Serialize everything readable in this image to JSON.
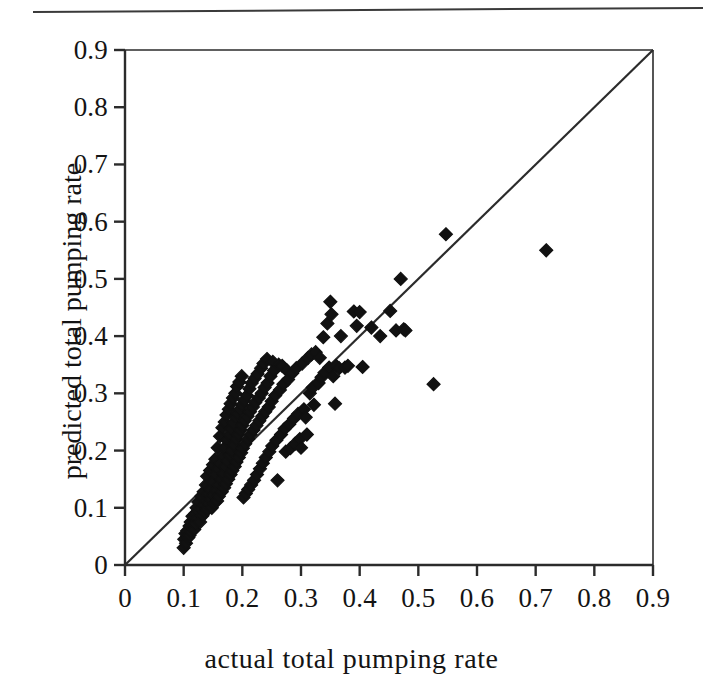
{
  "figure": {
    "top_rule": "horizontal-rule",
    "background_color": "#ffffff",
    "marker_color": "#111111",
    "axis_color": "#2b2b2b"
  },
  "chart_data": {
    "type": "scatter",
    "title": "",
    "subtitle": "",
    "xlabel": "actual  total  pumping  rate",
    "ylabel": "predicted total pumping rate",
    "xlim": [
      0,
      0.9
    ],
    "ylim": [
      0,
      0.9
    ],
    "xticks": [
      0,
      0.1,
      0.2,
      0.3,
      0.4,
      0.5,
      0.6,
      0.7,
      0.8,
      0.9
    ],
    "yticks": [
      0,
      0.1,
      0.2,
      0.3,
      0.4,
      0.5,
      0.6,
      0.7,
      0.8,
      0.9
    ],
    "xtick_labels": [
      "0",
      "0.1",
      "0.2",
      "0.3",
      "0.4",
      "0.5",
      "0.6",
      "0.7",
      "0.8",
      "0.9"
    ],
    "ytick_labels": [
      "0",
      "0.1",
      "0.2",
      "0.3",
      "0.4",
      "0.5",
      "0.6",
      "0.7",
      "0.8",
      "0.9"
    ],
    "grid": false,
    "legend": null,
    "legend_position": "none",
    "marker": "diamond",
    "marker_size": 13,
    "reference_line": {
      "name": "one-to-one-line",
      "kind": "identity",
      "from": [
        0,
        0
      ],
      "to": [
        0.9,
        0.9
      ],
      "label": "1:1 line"
    },
    "annotations": [],
    "points": [
      [
        0.1,
        0.03
      ],
      [
        0.101,
        0.045
      ],
      [
        0.103,
        0.055
      ],
      [
        0.104,
        0.038
      ],
      [
        0.106,
        0.06
      ],
      [
        0.108,
        0.048
      ],
      [
        0.11,
        0.068
      ],
      [
        0.11,
        0.052
      ],
      [
        0.112,
        0.075
      ],
      [
        0.113,
        0.058
      ],
      [
        0.115,
        0.085
      ],
      [
        0.116,
        0.07
      ],
      [
        0.118,
        0.062
      ],
      [
        0.12,
        0.09
      ],
      [
        0.12,
        0.072
      ],
      [
        0.122,
        0.1
      ],
      [
        0.124,
        0.082
      ],
      [
        0.125,
        0.11
      ],
      [
        0.126,
        0.092
      ],
      [
        0.128,
        0.075
      ],
      [
        0.13,
        0.12
      ],
      [
        0.13,
        0.098
      ],
      [
        0.132,
        0.086
      ],
      [
        0.134,
        0.128
      ],
      [
        0.135,
        0.105
      ],
      [
        0.136,
        0.092
      ],
      [
        0.138,
        0.14
      ],
      [
        0.139,
        0.112
      ],
      [
        0.14,
        0.155
      ],
      [
        0.14,
        0.098
      ],
      [
        0.142,
        0.125
      ],
      [
        0.143,
        0.108
      ],
      [
        0.145,
        0.165
      ],
      [
        0.146,
        0.132
      ],
      [
        0.147,
        0.115
      ],
      [
        0.148,
        0.1
      ],
      [
        0.15,
        0.175
      ],
      [
        0.15,
        0.145
      ],
      [
        0.151,
        0.122
      ],
      [
        0.152,
        0.108
      ],
      [
        0.154,
        0.185
      ],
      [
        0.155,
        0.158
      ],
      [
        0.156,
        0.13
      ],
      [
        0.157,
        0.112
      ],
      [
        0.158,
        0.205
      ],
      [
        0.159,
        0.168
      ],
      [
        0.16,
        0.14
      ],
      [
        0.16,
        0.12
      ],
      [
        0.162,
        0.225
      ],
      [
        0.163,
        0.178
      ],
      [
        0.164,
        0.15
      ],
      [
        0.165,
        0.128
      ],
      [
        0.166,
        0.24
      ],
      [
        0.167,
        0.19
      ],
      [
        0.168,
        0.16
      ],
      [
        0.169,
        0.135
      ],
      [
        0.17,
        0.25
      ],
      [
        0.17,
        0.205
      ],
      [
        0.171,
        0.172
      ],
      [
        0.172,
        0.142
      ],
      [
        0.173,
        0.262
      ],
      [
        0.174,
        0.218
      ],
      [
        0.175,
        0.182
      ],
      [
        0.176,
        0.15
      ],
      [
        0.177,
        0.272
      ],
      [
        0.178,
        0.228
      ],
      [
        0.179,
        0.192
      ],
      [
        0.18,
        0.158
      ],
      [
        0.18,
        0.282
      ],
      [
        0.181,
        0.238
      ],
      [
        0.182,
        0.2
      ],
      [
        0.183,
        0.165
      ],
      [
        0.184,
        0.292
      ],
      [
        0.185,
        0.248
      ],
      [
        0.186,
        0.21
      ],
      [
        0.187,
        0.172
      ],
      [
        0.188,
        0.3
      ],
      [
        0.189,
        0.258
      ],
      [
        0.19,
        0.22
      ],
      [
        0.19,
        0.18
      ],
      [
        0.191,
        0.312
      ],
      [
        0.192,
        0.265
      ],
      [
        0.193,
        0.228
      ],
      [
        0.194,
        0.188
      ],
      [
        0.195,
        0.32
      ],
      [
        0.196,
        0.272
      ],
      [
        0.197,
        0.236
      ],
      [
        0.198,
        0.196
      ],
      [
        0.199,
        0.33
      ],
      [
        0.2,
        0.28
      ],
      [
        0.2,
        0.244
      ],
      [
        0.201,
        0.204
      ],
      [
        0.202,
        0.118
      ],
      [
        0.203,
        0.288
      ],
      [
        0.204,
        0.252
      ],
      [
        0.205,
        0.212
      ],
      [
        0.206,
        0.125
      ],
      [
        0.208,
        0.296
      ],
      [
        0.209,
        0.26
      ],
      [
        0.21,
        0.22
      ],
      [
        0.21,
        0.132
      ],
      [
        0.212,
        0.308
      ],
      [
        0.213,
        0.268
      ],
      [
        0.214,
        0.228
      ],
      [
        0.215,
        0.14
      ],
      [
        0.216,
        0.318
      ],
      [
        0.218,
        0.276
      ],
      [
        0.219,
        0.236
      ],
      [
        0.22,
        0.148
      ],
      [
        0.221,
        0.326
      ],
      [
        0.222,
        0.284
      ],
      [
        0.224,
        0.244
      ],
      [
        0.225,
        0.158
      ],
      [
        0.226,
        0.334
      ],
      [
        0.228,
        0.292
      ],
      [
        0.229,
        0.252
      ],
      [
        0.23,
        0.168
      ],
      [
        0.232,
        0.344
      ],
      [
        0.233,
        0.3
      ],
      [
        0.234,
        0.26
      ],
      [
        0.235,
        0.178
      ],
      [
        0.236,
        0.352
      ],
      [
        0.238,
        0.31
      ],
      [
        0.239,
        0.268
      ],
      [
        0.24,
        0.188
      ],
      [
        0.242,
        0.36
      ],
      [
        0.243,
        0.318
      ],
      [
        0.245,
        0.276
      ],
      [
        0.246,
        0.198
      ],
      [
        0.248,
        0.33
      ],
      [
        0.25,
        0.286
      ],
      [
        0.251,
        0.208
      ],
      [
        0.252,
        0.355
      ],
      [
        0.254,
        0.34
      ],
      [
        0.256,
        0.296
      ],
      [
        0.258,
        0.218
      ],
      [
        0.26,
        0.148
      ],
      [
        0.262,
        0.35
      ],
      [
        0.264,
        0.306
      ],
      [
        0.266,
        0.228
      ],
      [
        0.268,
        0.348
      ],
      [
        0.27,
        0.316
      ],
      [
        0.272,
        0.238
      ],
      [
        0.274,
        0.198
      ],
      [
        0.276,
        0.34
      ],
      [
        0.278,
        0.324
      ],
      [
        0.28,
        0.246
      ],
      [
        0.282,
        0.204
      ],
      [
        0.285,
        0.335
      ],
      [
        0.288,
        0.256
      ],
      [
        0.29,
        0.212
      ],
      [
        0.292,
        0.344
      ],
      [
        0.295,
        0.264
      ],
      [
        0.298,
        0.22
      ],
      [
        0.3,
        0.205
      ],
      [
        0.302,
        0.352
      ],
      [
        0.305,
        0.272
      ],
      [
        0.308,
        0.258
      ],
      [
        0.31,
        0.228
      ],
      [
        0.312,
        0.362
      ],
      [
        0.315,
        0.3
      ],
      [
        0.318,
        0.368
      ],
      [
        0.32,
        0.31
      ],
      [
        0.322,
        0.28
      ],
      [
        0.325,
        0.372
      ],
      [
        0.33,
        0.318
      ],
      [
        0.332,
        0.362
      ],
      [
        0.335,
        0.328
      ],
      [
        0.338,
        0.398
      ],
      [
        0.34,
        0.336
      ],
      [
        0.345,
        0.422
      ],
      [
        0.348,
        0.345
      ],
      [
        0.35,
        0.46
      ],
      [
        0.352,
        0.438
      ],
      [
        0.355,
        0.33
      ],
      [
        0.358,
        0.282
      ],
      [
        0.36,
        0.348
      ],
      [
        0.365,
        0.344
      ],
      [
        0.368,
        0.4
      ],
      [
        0.375,
        0.345
      ],
      [
        0.38,
        0.348
      ],
      [
        0.39,
        0.443
      ],
      [
        0.395,
        0.418
      ],
      [
        0.4,
        0.442
      ],
      [
        0.405,
        0.346
      ],
      [
        0.42,
        0.415
      ],
      [
        0.435,
        0.4
      ],
      [
        0.452,
        0.444
      ],
      [
        0.462,
        0.41
      ],
      [
        0.47,
        0.5
      ],
      [
        0.475,
        0.412
      ],
      [
        0.478,
        0.41
      ],
      [
        0.526,
        0.316
      ],
      [
        0.547,
        0.578
      ],
      [
        0.718,
        0.55
      ]
    ]
  },
  "axes": {
    "x": {
      "label": "actual  total  pumping  rate",
      "ticks": [
        {
          "value": 0,
          "label": "0"
        },
        {
          "value": 0.1,
          "label": "0.1"
        },
        {
          "value": 0.2,
          "label": "0.2"
        },
        {
          "value": 0.3,
          "label": "0.3"
        },
        {
          "value": 0.4,
          "label": "0.4"
        },
        {
          "value": 0.5,
          "label": "0.5"
        },
        {
          "value": 0.6,
          "label": "0.6"
        },
        {
          "value": 0.7,
          "label": "0.7"
        },
        {
          "value": 0.8,
          "label": "0.8"
        },
        {
          "value": 0.9,
          "label": "0.9"
        }
      ]
    },
    "y": {
      "label": "predicted total pumping rate",
      "ticks": [
        {
          "value": 0,
          "label": "0"
        },
        {
          "value": 0.1,
          "label": "0.1"
        },
        {
          "value": 0.2,
          "label": "0.2"
        },
        {
          "value": 0.3,
          "label": "0.3"
        },
        {
          "value": 0.4,
          "label": "0.4"
        },
        {
          "value": 0.5,
          "label": "0.5"
        },
        {
          "value": 0.6,
          "label": "0.6"
        },
        {
          "value": 0.7,
          "label": "0.7"
        },
        {
          "value": 0.8,
          "label": "0.8"
        },
        {
          "value": 0.9,
          "label": "0.9"
        }
      ]
    }
  }
}
